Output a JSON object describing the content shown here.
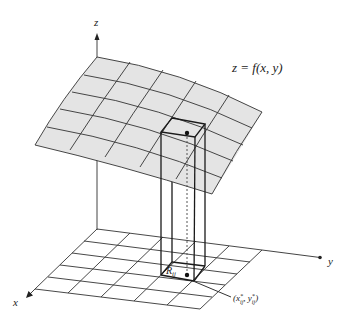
{
  "figure": {
    "type": "3d-surface-diagram",
    "surface_label": "z = f(x, y)",
    "axes": {
      "x_label": "x",
      "y_label": "y",
      "z_label": "z"
    },
    "region_label": "R",
    "region_subscript": "ij",
    "point_label": "(x*ij, y*ij)",
    "point_label_parts": {
      "open": "(",
      "x": "x",
      "x_sup": "*",
      "x_sub": "ij",
      "comma": ", ",
      "y": "y",
      "y_sup": "*",
      "y_sub": "ij",
      "close": ")"
    },
    "grid": {
      "rows": 5,
      "cols": 5
    },
    "colors": {
      "surface": "#e4e4e4",
      "lines": "#333333",
      "background": "#ffffff"
    }
  }
}
